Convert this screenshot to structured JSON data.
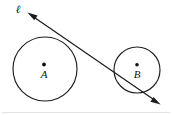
{
  "figure": {
    "background_color": "#ffffff",
    "ink_color": "#1d1d1d",
    "width": 172,
    "height": 115,
    "circles": [
      {
        "id": "A",
        "label": "A",
        "center_label": "A",
        "cx": 45,
        "cy": 69,
        "r": 32,
        "center_dot": true,
        "role": "large-circle"
      },
      {
        "id": "B",
        "label": "B",
        "center_label": "B",
        "cx": 137,
        "cy": 70,
        "r": 23,
        "center_dot": true,
        "role": "small-circle"
      }
    ],
    "line": {
      "label": "ℓ",
      "label_x": 18,
      "label_y": 12,
      "start_x": 28,
      "start_y": 13,
      "end_x": 160,
      "end_y": 104,
      "double_arrow": true,
      "description": "line tangent to circle A upper-right and crossing circle B lower-left"
    },
    "labels": {
      "circle_a": "A",
      "circle_b": "B",
      "line_ell": "ℓ"
    }
  }
}
